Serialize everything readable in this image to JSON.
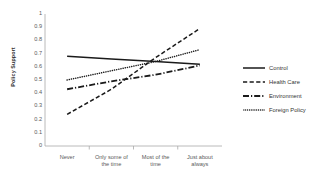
{
  "chart_data": {
    "type": "line",
    "title": "",
    "xlabel": "",
    "ylabel": "Policy Support",
    "ylim": [
      0,
      1
    ],
    "ytick_labels": [
      "1",
      "0.9",
      "0.8",
      "0.7",
      "0.6",
      "0.5",
      "0.4",
      "0.3",
      "0.2",
      "0.1",
      "0"
    ],
    "ytick_values": [
      1,
      0.9,
      0.8,
      0.7,
      0.6,
      0.5,
      0.4,
      0.3,
      0.2,
      0.1,
      0
    ],
    "categories": [
      "Never",
      "Only some of the time",
      "Most of the time",
      "Just about always"
    ],
    "grid": false,
    "legend_position": "right",
    "series": [
      {
        "name": "Control",
        "style": "solid",
        "values": [
          0.68,
          0.66,
          0.64,
          0.62
        ]
      },
      {
        "name": "Health Care",
        "style": "dashed",
        "values": [
          0.24,
          0.43,
          0.67,
          0.89
        ]
      },
      {
        "name": "Environment",
        "style": "dash-dot",
        "values": [
          0.43,
          0.49,
          0.54,
          0.61
        ]
      },
      {
        "name": "Foreign Policy",
        "style": "dotted",
        "values": [
          0.5,
          0.57,
          0.64,
          0.73
        ]
      }
    ]
  },
  "axes": {
    "y_label": "Policy Support",
    "y_ticks": [
      "1",
      "0.9",
      "0.8",
      "0.7",
      "0.6",
      "0.5",
      "0.4",
      "0.3",
      "0.2",
      "0.1",
      "0"
    ],
    "x_ticks": [
      {
        "line1": "Never",
        "line2": ""
      },
      {
        "line1": "Only some of",
        "line2": "the time"
      },
      {
        "line1": "Most of the",
        "line2": "time"
      },
      {
        "line1": "Just about",
        "line2": "always"
      }
    ]
  },
  "legend": {
    "items": [
      {
        "label": "Control",
        "style": "solid"
      },
      {
        "label": "Health Care",
        "style": "dashed"
      },
      {
        "label": "Environment",
        "style": "dash-dot"
      },
      {
        "label": "Foreign Policy",
        "style": "dotted"
      }
    ]
  },
  "colors": {
    "line": "#1a1a1a",
    "axis": "#9a9a9a",
    "text": "#5a5a5a",
    "background": "#ffffff"
  }
}
